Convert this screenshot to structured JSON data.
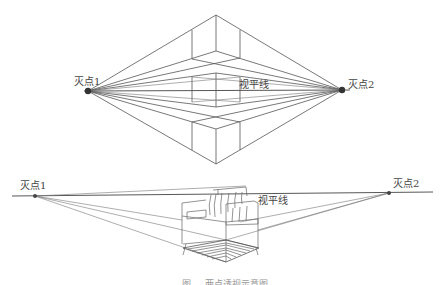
{
  "top_diagram": {
    "vanishing_point_1": {
      "label": "灭点1",
      "x": 88,
      "y": 91
    },
    "vanishing_point_2": {
      "label": "灭点2",
      "x": 342,
      "y": 90
    },
    "horizon_label": "视平线"
  },
  "bottom_diagram": {
    "vanishing_point_1": {
      "label": "灭点1",
      "x": 35,
      "y": 196
    },
    "vanishing_point_2": {
      "label": "灭点2",
      "x": 389,
      "y": 193
    },
    "horizon_label": "视平线"
  },
  "caption": "图 … 两点透视示意图",
  "colors": {
    "line": "#555555",
    "point": "#333333",
    "background": "#ffffff"
  }
}
